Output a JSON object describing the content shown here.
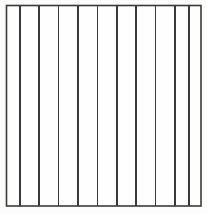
{
  "figure": {
    "canvas": {
      "width": 207,
      "height": 214
    },
    "background_color": "#fdfdfb",
    "stroke_color": "#3a3a3a",
    "fill_color": "#fefefe",
    "stroke_width": 1.6,
    "frame": {
      "x": 6.5,
      "y": 5.5,
      "width": 194.5,
      "height": 200.5,
      "right": 201,
      "bottom": 206
    },
    "vertical_line_count": 10,
    "column_count": 11,
    "vertical_lines_x": [
      20,
      39,
      58.3,
      78,
      97.3,
      116.7,
      136,
      155.3,
      174.7,
      188.7
    ],
    "column_widths": [
      13.5,
      19,
      19.3,
      19.7,
      19.3,
      19.4,
      19.3,
      19.3,
      19.4,
      14,
      12.3
    ],
    "line_top_y": 5.5,
    "line_bottom_y": 206
  },
  "labels": {
    "figure_caption": "",
    "axis_labels": [],
    "tick_labels": []
  }
}
